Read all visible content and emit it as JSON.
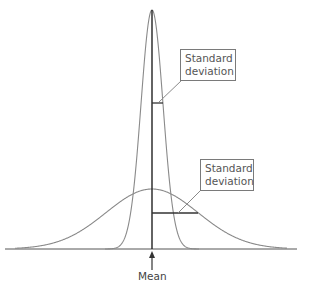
{
  "diagram": {
    "title": "",
    "labels": {
      "upper_sd": {
        "line1": "Standard",
        "line2": "deviation"
      },
      "lower_sd": {
        "line1": "Standard",
        "line2": "deviation"
      },
      "mean": "Mean"
    },
    "curves": [
      {
        "name": "narrow-distribution",
        "mean_x": 152,
        "peak_y": 10,
        "sd_px": 11,
        "sd_marker_y": 103
      },
      {
        "name": "wide-distribution",
        "mean_x": 152,
        "peak_y": 189,
        "sd_px": 46,
        "sd_marker_y": 213
      }
    ],
    "colors": {
      "curve": "#8a8a8a",
      "axis": "#555555",
      "mean_line": "#222222",
      "sd_line": "#333333",
      "box_border": "#7a7a7a",
      "text": "#555555"
    }
  }
}
